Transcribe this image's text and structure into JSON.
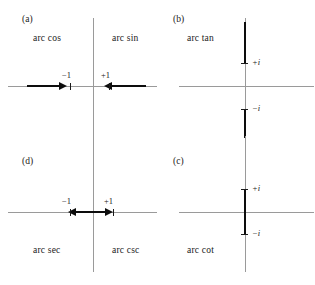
{
  "figure": {
    "colors": {
      "axis": "#9a9a9a",
      "cut": "#0d0d0d",
      "tick": "#1a1a1a",
      "background": "#ffffff"
    }
  },
  "panels": {
    "a": {
      "tag": "(a)",
      "label_left": "arc cos",
      "label_right": "arc sin",
      "tick_labels": {
        "negative": "−1",
        "positive": "+1"
      },
      "cut_description": "two horizontal rays on the real axis from −∞ to −1 and from +1 to +∞, arrowheads pointing inward toward ±1",
      "cut_axis": "real",
      "cut_type": "outer-rays"
    },
    "b": {
      "tag": "(b)",
      "label_left": "arc tan",
      "tick_labels": {
        "positive": "+i",
        "negative": "−i"
      },
      "cut_description": "two vertical rays on the imaginary axis from +i upward and from −i downward",
      "cut_axis": "imaginary",
      "cut_type": "outer-rays"
    },
    "c": {
      "tag": "(c)",
      "label_left": "arc cot",
      "tick_labels": {
        "positive": "+i",
        "negative": "−i"
      },
      "cut_description": "single vertical segment on the imaginary axis joining −i to +i through the origin",
      "cut_axis": "imaginary",
      "cut_type": "inner-segment"
    },
    "d": {
      "tag": "(d)",
      "label_left": "arc sec",
      "label_right": "arc csc",
      "tick_labels": {
        "negative": "−1",
        "positive": "+1"
      },
      "cut_description": "single horizontal segment on the real axis joining −1 to +1 through the origin, arrowheads at both ends pointing outward",
      "cut_axis": "real",
      "cut_type": "inner-segment"
    }
  }
}
